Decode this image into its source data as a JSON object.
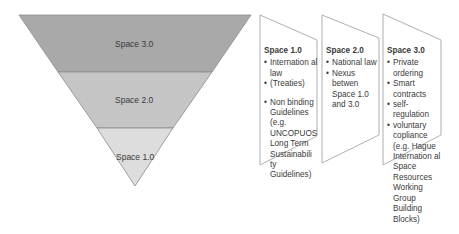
{
  "pyramid": {
    "levels": [
      {
        "label": "Space 3.0",
        "color": "#a9a9a9"
      },
      {
        "label": "Space 2.0",
        "color": "#c5c5c5"
      },
      {
        "label": "Space 1.0",
        "color": "#dddddd"
      }
    ]
  },
  "panels": [
    {
      "title": "Space 1.0",
      "items": [
        "Internation al law",
        "(Treaties)",
        "Non binding Guidelines (e.g. UNCOPUOS Long Term Sustainabili ty Guidelines)"
      ]
    },
    {
      "title": "Space 2.0",
      "items": [
        "National law",
        "Nexus betwen Space 1.0 and 3.0"
      ]
    },
    {
      "title": "Space 3.0",
      "items": [
        "Private ordering",
        "Smart contracts",
        "self-regulation",
        "voluntary copliance (e.g. Hague Internation al Space Resources Working Group Building Blocks)"
      ]
    }
  ]
}
